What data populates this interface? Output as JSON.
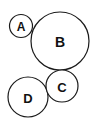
{
  "diagram": {
    "title": "",
    "circles": [
      {
        "label": "A",
        "cx": 21,
        "cy": 26,
        "r": 11.5,
        "font_size": 12
      },
      {
        "label": "B",
        "cx": 60,
        "cy": 41,
        "r": 29,
        "font_size": 14
      },
      {
        "label": "C",
        "cx": 62,
        "cy": 86,
        "r": 16,
        "font_size": 13
      },
      {
        "label": "D",
        "cx": 28,
        "cy": 97,
        "r": 20,
        "font_size": 13
      }
    ],
    "stroke_color": "#1a1a1a",
    "background": "#ffffff"
  }
}
